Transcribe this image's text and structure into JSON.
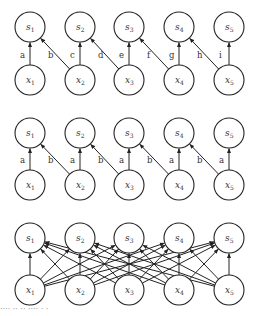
{
  "diagram": {
    "columns": [
      30,
      80,
      129,
      179,
      229
    ],
    "radius": 15,
    "panels": [
      {
        "name": "locally-connected",
        "s_y": 27,
        "x_y": 80,
        "top_nodes": [
          "s1",
          "s2",
          "s3",
          "s4",
          "s5"
        ],
        "bottom_nodes": [
          "x1",
          "x2",
          "x3",
          "x4",
          "x5"
        ],
        "edges": [
          {
            "from": 0,
            "to": 0,
            "label": "a"
          },
          {
            "from": 1,
            "to": 0,
            "label": "b"
          },
          {
            "from": 1,
            "to": 1,
            "label": "c"
          },
          {
            "from": 2,
            "to": 1,
            "label": "d"
          },
          {
            "from": 2,
            "to": 2,
            "label": "e"
          },
          {
            "from": 3,
            "to": 2,
            "label": "f"
          },
          {
            "from": 3,
            "to": 3,
            "label": "g"
          },
          {
            "from": 4,
            "to": 3,
            "label": "h"
          },
          {
            "from": 4,
            "to": 4,
            "label": "i"
          }
        ]
      },
      {
        "name": "convolutional",
        "s_y": 133,
        "x_y": 185,
        "top_nodes": [
          "s1",
          "s2",
          "s3",
          "s4",
          "s5"
        ],
        "bottom_nodes": [
          "x1",
          "x2",
          "x3",
          "x4",
          "x5"
        ],
        "edges": [
          {
            "from": 0,
            "to": 0,
            "label": "a"
          },
          {
            "from": 1,
            "to": 0,
            "label": "b"
          },
          {
            "from": 1,
            "to": 1,
            "label": "a"
          },
          {
            "from": 2,
            "to": 1,
            "label": "b"
          },
          {
            "from": 2,
            "to": 2,
            "label": "a"
          },
          {
            "from": 3,
            "to": 2,
            "label": "b"
          },
          {
            "from": 3,
            "to": 3,
            "label": "a"
          },
          {
            "from": 4,
            "to": 3,
            "label": "b"
          },
          {
            "from": 4,
            "to": 4,
            "label": "a"
          }
        ]
      },
      {
        "name": "fully-connected",
        "s_y": 238,
        "x_y": 290,
        "top_nodes": [
          "s1",
          "s2",
          "s3",
          "s4",
          "s5"
        ],
        "bottom_nodes": [
          "x1",
          "x2",
          "x3",
          "x4",
          "x5"
        ],
        "fully_connected": true
      }
    ]
  },
  "caption": {
    "text": "···· ·· ·· ···· · ·"
  }
}
